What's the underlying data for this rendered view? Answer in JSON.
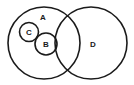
{
  "diagram": {
    "type": "venn-euler",
    "stroke_color": "#1a1a1a",
    "background": "#ffffff",
    "sets": [
      {
        "id": "A",
        "label": "A",
        "cx": 44,
        "cy": 43,
        "r": 36,
        "label_x": 43,
        "label_y": 17
      },
      {
        "id": "D",
        "label": "D",
        "cx": 91,
        "cy": 43,
        "r": 36,
        "label_x": 93,
        "label_y": 44
      },
      {
        "id": "C",
        "label": "C",
        "cx": 29,
        "cy": 32,
        "r": 9.5,
        "label_x": 29,
        "label_y": 32
      },
      {
        "id": "B",
        "label": "B",
        "cx": 46,
        "cy": 44,
        "r": 11,
        "label_x": 46,
        "label_y": 44
      }
    ],
    "relations": [
      "C is a subset of A",
      "B is a subset of A",
      "C and B touch (tangent)",
      "B touches the boundary of D",
      "A and D overlap"
    ]
  }
}
